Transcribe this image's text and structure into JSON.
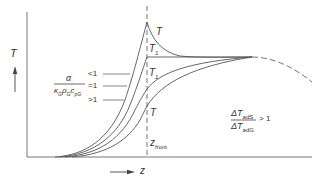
{
  "diagram": {
    "y_axis_label": "T",
    "x_axis_label": "z",
    "curve_labels": [
      "T",
      "T",
      "T",
      "T"
    ],
    "curve_label_subscripts": [
      "",
      "1",
      "1",
      ""
    ],
    "front_label": "z",
    "front_label_subscript": "front",
    "parameter": {
      "numerator": "α",
      "denominator_parts": [
        {
          "base": "κ",
          "sub": "G"
        },
        {
          "base": "ρ",
          "sub": "G"
        },
        {
          "base": "c",
          "sub": "pG"
        }
      ],
      "cases": [
        "<1",
        "=1",
        ">1"
      ]
    },
    "condition": {
      "numerator_base": "ΔT",
      "numerator_sub": "adS",
      "denominator_base": "ΔT",
      "denominator_sub": "adG",
      "relation": "> 1"
    },
    "colors": {
      "line": "#555555",
      "text": "#333333",
      "background": "#ffffff"
    }
  }
}
